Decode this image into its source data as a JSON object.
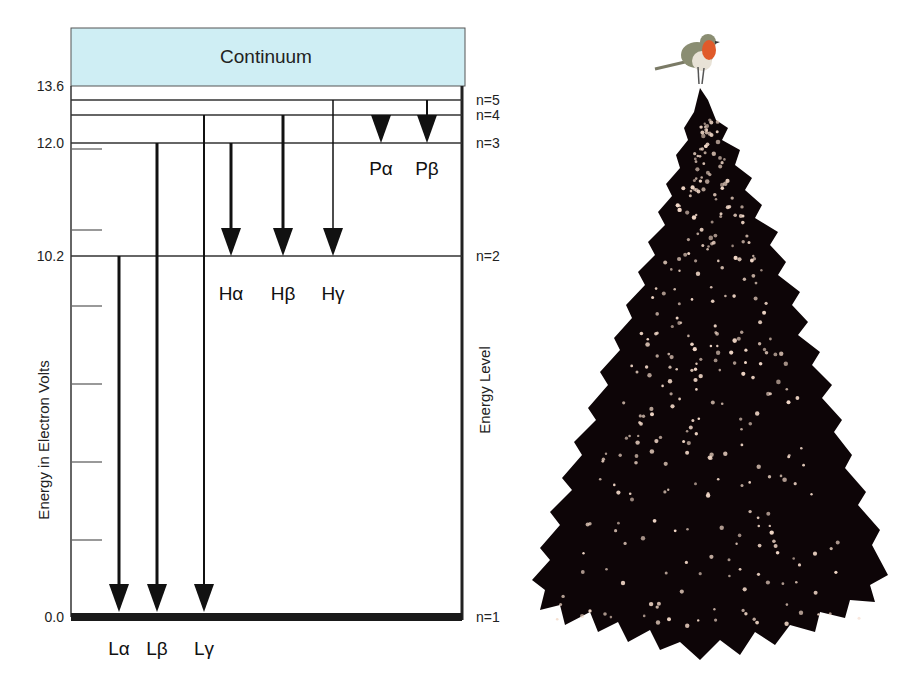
{
  "diagram": {
    "title_box": {
      "label": "Continuum",
      "fill": "#cfeef4"
    },
    "y_axis_label": "Energy in Electron Volts",
    "right_axis_label": "Energy Level",
    "energy_ticks": [
      {
        "label": "13.6",
        "y": 86
      },
      {
        "label": "12.0",
        "y": 143
      },
      {
        "label": "10.2",
        "y": 256
      },
      {
        "label": "0.0",
        "y": 617
      }
    ],
    "minor_tick_ys": [
      149,
      230,
      306,
      384,
      462,
      540
    ],
    "levels": [
      {
        "label": "n=5",
        "y": 100
      },
      {
        "label": "n=4",
        "y": 115
      },
      {
        "label": "n=3",
        "y": 143
      },
      {
        "label": "n=2",
        "y": 256
      },
      {
        "label": "n=1",
        "y": 617
      }
    ],
    "series": [
      {
        "name": "Lyman",
        "transitions": [
          {
            "label": "Lα",
            "x": 119,
            "from_y": 256,
            "to_y": 612,
            "weight": 3
          },
          {
            "label": "Lβ",
            "x": 157,
            "from_y": 143,
            "to_y": 612,
            "weight": 3
          },
          {
            "label": "Lγ",
            "x": 204,
            "from_y": 115,
            "to_y": 612,
            "weight": 2
          }
        ]
      },
      {
        "name": "Balmer",
        "transitions": [
          {
            "label": "Hα",
            "x": 231,
            "from_y": 143,
            "to_y": 256,
            "weight": 3
          },
          {
            "label": "Hβ",
            "x": 283,
            "from_y": 115,
            "to_y": 256,
            "weight": 3
          },
          {
            "label": "Hγ",
            "x": 333,
            "from_y": 100,
            "to_y": 256,
            "weight": 1.5
          }
        ]
      },
      {
        "name": "Paschen",
        "transitions": [
          {
            "label": "Pα",
            "x": 381,
            "from_y": 115,
            "to_y": 143,
            "weight": 3
          },
          {
            "label": "Pβ",
            "x": 427,
            "from_y": 100,
            "to_y": 143,
            "weight": 2
          }
        ]
      }
    ]
  },
  "illustration": {
    "tree": "christmas-tree-black-with-lights",
    "bird": "robin",
    "tree_color": "#0d0507",
    "light_color": "#f3d9c8",
    "bird_breast_color": "#e05a2a"
  }
}
